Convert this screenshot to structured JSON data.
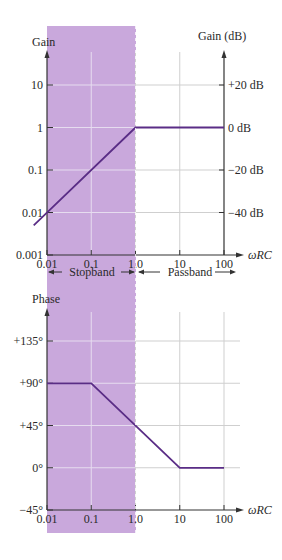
{
  "colors": {
    "stopband_shade": "#c9a8dc",
    "curve": "#5a2d86",
    "axis": "#333333",
    "grid": "#cfcfcf",
    "grid_on_shade": "#e6dcef"
  },
  "band_labels": {
    "stopband": "Stopband",
    "passband": "Passband"
  },
  "chart_data": [
    {
      "type": "line",
      "title": "",
      "xlabel": "ωRC",
      "ylabel": "Gain",
      "ylabel_right": "Gain (dB)",
      "xscale": "log",
      "yscale": "log",
      "xlim": [
        0.01,
        100
      ],
      "ylim": [
        0.001,
        30
      ],
      "x_ticks": [
        "0.01",
        "0.1",
        "1.0",
        "10",
        "100"
      ],
      "x_tick_values": [
        0.01,
        0.1,
        1,
        10,
        100
      ],
      "y_ticks": [
        "0.001",
        "0.01",
        "0.1",
        "1",
        "10"
      ],
      "y_tick_values": [
        0.001,
        0.01,
        0.1,
        1,
        10
      ],
      "y_ticks_right": [
        "−40 dB",
        "−20 dB",
        "0 dB",
        "+20 dB"
      ],
      "y_ticks_right_values": [
        0.01,
        0.1,
        1,
        10
      ],
      "grid": true,
      "shaded_region": {
        "label": "Stopband",
        "x_range": [
          0.01,
          1
        ]
      },
      "series": [
        {
          "name": "Gain",
          "x": [
            0.005,
            1,
            100
          ],
          "y": [
            0.005,
            1,
            1
          ]
        }
      ]
    },
    {
      "type": "line",
      "title": "",
      "xlabel": "ωRC",
      "ylabel": "Phase",
      "xscale": "log",
      "xlim": [
        0.01,
        100
      ],
      "ylim": [
        -45,
        170
      ],
      "x_ticks": [
        "0.01",
        "0.1",
        "1.0",
        "10",
        "100"
      ],
      "x_tick_values": [
        0.01,
        0.1,
        1,
        10,
        100
      ],
      "y_ticks": [
        "−45°",
        "0°",
        "+45°",
        "+90°",
        "+135°"
      ],
      "y_tick_values": [
        -45,
        0,
        45,
        90,
        135
      ],
      "grid": true,
      "shaded_region": {
        "label": "Stopband",
        "x_range": [
          0.01,
          1
        ]
      },
      "series": [
        {
          "name": "Phase",
          "x": [
            0.01,
            0.1,
            10,
            100
          ],
          "y": [
            90,
            90,
            0,
            0
          ]
        }
      ]
    }
  ]
}
